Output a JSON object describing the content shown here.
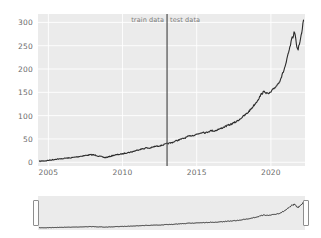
{
  "chart_data": {
    "type": "line",
    "title": "",
    "xlabel": "",
    "ylabel": "",
    "xlim": [
      2004.3,
      2022.3
    ],
    "ylim": [
      -8,
      318
    ],
    "grid": true,
    "legend_position": "none",
    "xticks": [
      2005,
      2010,
      2015,
      2020
    ],
    "yticks": [
      0,
      50,
      100,
      150,
      200,
      250,
      300
    ],
    "annotations": [
      {
        "name": "train-data-label",
        "text": "train data",
        "x": 2013.0,
        "align": "right"
      },
      {
        "name": "test-data-label",
        "text": "test data",
        "x": 2013.0,
        "align": "left"
      }
    ],
    "split_line": {
      "x": 2013.0,
      "color": "#4d4d4d"
    },
    "series": [
      {
        "name": "price",
        "color": "#2b2b2b",
        "x": [
          2004.4,
          2004.6,
          2004.8,
          2005.0,
          2005.2,
          2005.4,
          2005.6,
          2005.8,
          2006.0,
          2006.2,
          2006.4,
          2006.6,
          2006.8,
          2007.0,
          2007.2,
          2007.4,
          2007.6,
          2007.8,
          2008.0,
          2008.2,
          2008.4,
          2008.6,
          2008.8,
          2009.0,
          2009.2,
          2009.4,
          2009.6,
          2009.8,
          2010.0,
          2010.2,
          2010.4,
          2010.6,
          2010.8,
          2011.0,
          2011.2,
          2011.4,
          2011.6,
          2011.8,
          2012.0,
          2012.2,
          2012.4,
          2012.6,
          2012.8,
          2013.0,
          2013.2,
          2013.4,
          2013.6,
          2013.8,
          2014.0,
          2014.2,
          2014.4,
          2014.6,
          2014.8,
          2015.0,
          2015.2,
          2015.4,
          2015.6,
          2015.8,
          2016.0,
          2016.2,
          2016.4,
          2016.6,
          2016.8,
          2017.0,
          2017.2,
          2017.4,
          2017.6,
          2017.8,
          2018.0,
          2018.2,
          2018.4,
          2018.6,
          2018.8,
          2019.0,
          2019.2,
          2019.4,
          2019.6,
          2019.8,
          2020.0,
          2020.2,
          2020.4,
          2020.6,
          2020.8,
          2021.0,
          2021.2,
          2021.4,
          2021.6,
          2021.8,
          2022.0,
          2022.2
        ],
        "y": [
          2,
          3,
          3,
          4,
          5,
          6,
          7,
          7,
          8,
          9,
          9,
          10,
          11,
          12,
          13,
          14,
          15,
          16,
          16,
          15,
          13,
          12,
          10,
          11,
          13,
          15,
          16,
          17,
          18,
          20,
          21,
          22,
          24,
          26,
          28,
          29,
          31,
          30,
          32,
          34,
          35,
          36,
          38,
          40,
          41,
          43,
          46,
          48,
          50,
          52,
          55,
          57,
          58,
          60,
          62,
          65,
          63,
          66,
          68,
          67,
          70,
          72,
          75,
          78,
          80,
          83,
          86,
          90,
          95,
          100,
          105,
          112,
          120,
          128,
          138,
          148,
          152,
          146,
          150,
          158,
          165,
          175,
          190,
          210,
          235,
          262,
          280,
          240,
          262,
          305
        ]
      }
    ]
  },
  "axes": {
    "ytick_labels": [
      "300",
      "250",
      "200",
      "150",
      "100",
      "50",
      "0"
    ],
    "xtick_labels": [
      "2005",
      "2010",
      "2015",
      "2020"
    ]
  },
  "range_slider": {
    "name": "range-slider",
    "left_handle": "range-handle-left",
    "right_handle": "range-handle-right"
  },
  "colors": {
    "panel_background": "#ebebeb",
    "grid": "#ffffff",
    "series": "#2b2b2b",
    "split_line": "#4d4d4d",
    "tick_text": "#6b6b6b",
    "annotation_text": "#7a7a7a"
  }
}
